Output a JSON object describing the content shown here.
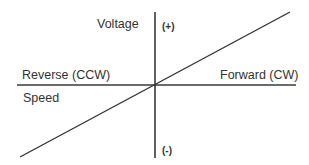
{
  "diagram": {
    "type": "voltage-speed-relationship",
    "axes": {
      "vertical": {
        "label": "Voltage",
        "positive_label": "(+)",
        "negative_label": "(-)"
      },
      "horizontal": {
        "negative_label": "Reverse (CCW)",
        "positive_label": "Forward (CW)",
        "label": "Speed"
      }
    },
    "line": {
      "description": "linear, passes through origin",
      "color": "#333333"
    },
    "colors": {
      "axis": "#3a3a3a",
      "line": "#333333",
      "text": "#333333",
      "background": "#ffffff"
    }
  }
}
